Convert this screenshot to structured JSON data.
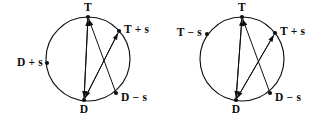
{
  "figure": {
    "colors": {
      "stroke": "#101010",
      "background": "#ffffff",
      "label": "#0d0d0d"
    },
    "diagrams": [
      {
        "id": "left-diagram",
        "name": "left-circle-diagram",
        "circle": {
          "cx": 88,
          "cy": 59,
          "r": 42
        },
        "nodes": [
          {
            "id": "T",
            "label": "T",
            "x": 88,
            "y": 17,
            "label_x": 88,
            "label_y": 11,
            "anchor": "middle"
          },
          {
            "id": "T+s",
            "label": "T + s",
            "x": 119,
            "y": 31,
            "label_x": 124,
            "label_y": 33,
            "anchor": "start"
          },
          {
            "id": "D+s",
            "label": "D + s",
            "x": 47,
            "y": 63,
            "label_x": 43,
            "label_y": 66,
            "anchor": "end"
          },
          {
            "id": "D",
            "label": "D",
            "x": 84,
            "y": 100,
            "label_x": 84,
            "label_y": 113,
            "anchor": "middle"
          },
          {
            "id": "D-s",
            "label": "D − s",
            "x": 116,
            "y": 93,
            "label_x": 121,
            "label_y": 101,
            "anchor": "start"
          }
        ],
        "arrows": [
          {
            "id": "D-to-T",
            "from": "D",
            "to": "T"
          },
          {
            "id": "Dms-to-T",
            "from": "D-s",
            "to": "T"
          },
          {
            "id": "T-to-D",
            "from": "T",
            "to": "D"
          },
          {
            "id": "Tps-to-D",
            "from": "T+s",
            "to": "D"
          },
          {
            "id": "D-to-Tps",
            "from": "D",
            "to": "T+s"
          }
        ]
      },
      {
        "id": "right-diagram",
        "name": "right-circle-diagram",
        "circle": {
          "cx": 242,
          "cy": 59,
          "r": 42
        },
        "nodes": [
          {
            "id": "T",
            "label": "T",
            "x": 242,
            "y": 17,
            "label_x": 242,
            "label_y": 11,
            "anchor": "middle"
          },
          {
            "id": "T+s",
            "label": "T + s",
            "x": 275,
            "y": 33,
            "label_x": 280,
            "label_y": 35,
            "anchor": "start"
          },
          {
            "id": "T-s",
            "label": "T − s",
            "x": 207,
            "y": 34,
            "label_x": 202,
            "label_y": 36,
            "anchor": "end"
          },
          {
            "id": "D",
            "label": "D",
            "x": 236,
            "y": 100,
            "label_x": 236,
            "label_y": 113,
            "anchor": "middle"
          },
          {
            "id": "D-s",
            "label": "D − s",
            "x": 270,
            "y": 93,
            "label_x": 275,
            "label_y": 101,
            "anchor": "start"
          }
        ],
        "arrows": [
          {
            "id": "D-to-T",
            "from": "D",
            "to": "T"
          },
          {
            "id": "Dms-to-T",
            "from": "D-s",
            "to": "T"
          },
          {
            "id": "T-to-D",
            "from": "T",
            "to": "D"
          },
          {
            "id": "Tps-to-D",
            "from": "T+s",
            "to": "D"
          },
          {
            "id": "D-to-Tps",
            "from": "D",
            "to": "T+s"
          }
        ]
      }
    ]
  }
}
